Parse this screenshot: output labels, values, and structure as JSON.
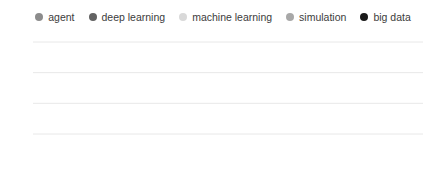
{
  "legend": {
    "position": "top-center",
    "items": [
      {
        "label": "agent",
        "color": "#8c8c8c",
        "icon": "legend-dot-icon"
      },
      {
        "label": "deep learning",
        "color": "#636363",
        "icon": "legend-dot-icon"
      },
      {
        "label": "machine learning",
        "color": "#d9d9d9",
        "icon": "legend-dot-icon"
      },
      {
        "label": "simulation",
        "color": "#a8a8a8",
        "icon": "legend-dot-icon"
      },
      {
        "label": "big data",
        "color": "#1a1a1a",
        "icon": "legend-dot-icon"
      }
    ]
  },
  "axes": {
    "y_ticks": [
      "100",
      "75",
      "50",
      "25"
    ],
    "y_values": [
      100,
      75,
      50,
      25
    ],
    "x_ticks": [
      "2004",
      "2009",
      "2015"
    ],
    "x_tick_values": [
      2004,
      2009,
      2015
    ]
  },
  "chart_data": {
    "type": "line",
    "title": "",
    "xlabel": "",
    "ylabel": "",
    "xlim": [
      2004,
      2020.75
    ],
    "ylim": [
      0,
      107
    ],
    "grid": "horizontal",
    "legend_position": "top-center",
    "x_tick_labels": [
      "2004",
      "2009",
      "2015"
    ],
    "y_tick_labels": [
      "25",
      "50",
      "75",
      "100"
    ],
    "x_start": 2004,
    "x_step": 0.25,
    "series": [
      {
        "name": "agent",
        "color": "#8c8c8c",
        "values": [
          78,
          74,
          77,
          72,
          69,
          74,
          71,
          66,
          70,
          73,
          68,
          64,
          67,
          70,
          65,
          61,
          64,
          66,
          60,
          57,
          60,
          62,
          57,
          53,
          56,
          58,
          53,
          50,
          52,
          55,
          50,
          47,
          62,
          58,
          47,
          44,
          46,
          55,
          44,
          41,
          43,
          46,
          41,
          38,
          40,
          42,
          38,
          36,
          38,
          40,
          35,
          33,
          35,
          37,
          33,
          31,
          33,
          35,
          31,
          29,
          31,
          33,
          30,
          28,
          30,
          32,
          28,
          27,
          29,
          30,
          27
        ]
      },
      {
        "name": "deep learning",
        "color": "#636363",
        "values": [
          36,
          33,
          38,
          34,
          31,
          36,
          33,
          30,
          35,
          32,
          29,
          34,
          31,
          28,
          33,
          30,
          27,
          32,
          29,
          27,
          31,
          28,
          26,
          30,
          28,
          25,
          29,
          27,
          25,
          28,
          26,
          24,
          27,
          25,
          24,
          26,
          25,
          23,
          26,
          24,
          23,
          25,
          24,
          23,
          25,
          24,
          23,
          25,
          24,
          23,
          25,
          24,
          24,
          26,
          25,
          24,
          26,
          25,
          24,
          26,
          25,
          25,
          27,
          26,
          25,
          27,
          26,
          26,
          28,
          27,
          27
        ]
      },
      {
        "name": "machine learning",
        "color": "#d9d9d9",
        "values": [
          20,
          19,
          21,
          19,
          17,
          19,
          18,
          16,
          18,
          17,
          16,
          17,
          16,
          15,
          17,
          16,
          15,
          16,
          15,
          14,
          16,
          15,
          14,
          15,
          15,
          14,
          15,
          14,
          14,
          15,
          14,
          14,
          15,
          15,
          14,
          15,
          15,
          15,
          16,
          16,
          16,
          17,
          17,
          17,
          18,
          19,
          19,
          20,
          21,
          22,
          24,
          26,
          28,
          31,
          34,
          37,
          41,
          45,
          49,
          54,
          58,
          63,
          67,
          72,
          76,
          81,
          85,
          90,
          95,
          100,
          88
        ]
      },
      {
        "name": "simulation",
        "color": "#a8a8a8",
        "values": [
          29,
          27,
          30,
          28,
          26,
          29,
          27,
          25,
          28,
          26,
          25,
          27,
          26,
          24,
          27,
          25,
          24,
          26,
          25,
          24,
          26,
          25,
          24,
          25,
          24,
          23,
          25,
          24,
          23,
          25,
          24,
          23,
          25,
          24,
          23,
          25,
          24,
          23,
          25,
          24,
          24,
          25,
          24,
          24,
          26,
          25,
          24,
          26,
          25,
          25,
          27,
          26,
          25,
          27,
          26,
          26,
          27,
          26,
          26,
          28,
          27,
          26,
          28,
          27,
          27,
          28,
          27,
          27,
          29,
          28,
          28
        ]
      },
      {
        "name": "big data",
        "color": "#1a1a1a",
        "values": [
          2,
          2,
          2,
          2,
          2,
          2,
          2,
          2,
          2,
          2,
          2,
          2,
          2,
          2,
          2,
          2,
          2,
          2,
          2,
          2,
          2,
          2,
          2,
          2,
          2,
          2,
          2,
          3,
          3,
          3,
          3,
          3,
          3,
          3,
          3,
          3,
          4,
          4,
          4,
          4,
          5,
          5,
          5,
          6,
          6,
          7,
          7,
          8,
          9,
          10,
          11,
          12,
          13,
          14,
          15,
          15,
          16,
          16,
          17,
          17,
          17,
          17,
          17,
          17,
          17,
          17,
          17,
          17,
          18,
          18,
          18
        ]
      }
    ]
  }
}
